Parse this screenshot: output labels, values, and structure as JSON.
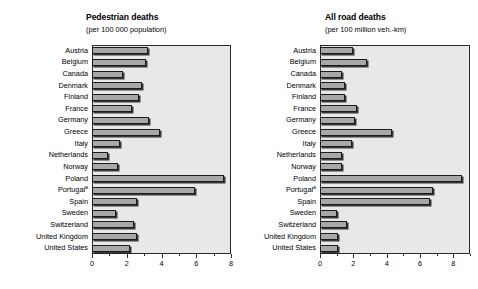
{
  "figure": {
    "background_color": "#ffffff",
    "plot_background_color": "#e8e8e8",
    "bar_color": "#a8a8a8",
    "bar_border_color": "#1c1c1c"
  },
  "chart_data": [
    {
      "type": "bar",
      "orientation": "horizontal",
      "title": "Pedestrian deaths",
      "subtitle": "(per 100 000 population)",
      "xlabel": "",
      "ylabel": "",
      "xlim": [
        0,
        8
      ],
      "xticks": [
        0,
        2,
        4,
        6,
        8
      ],
      "xtick_labels": [
        "0",
        "2",
        "4",
        "6",
        "8"
      ],
      "grid": false,
      "legend": false,
      "categories": [
        "Austria",
        "Belgium",
        "Canada",
        "Denmark",
        "Finland",
        "France",
        "Germany",
        "Greece",
        "Italy",
        "Netherlands",
        "Norway",
        "Poland",
        "Portugal",
        "Spain",
        "Sweden",
        "Switzerland",
        "United Kingdom",
        "United States"
      ],
      "category_footnotes": {
        "Portugal": "a"
      },
      "values": [
        3.2,
        3.1,
        1.8,
        2.9,
        2.7,
        2.3,
        3.3,
        3.9,
        1.6,
        0.9,
        1.5,
        7.6,
        5.9,
        2.6,
        1.4,
        2.4,
        2.6,
        2.2
      ]
    },
    {
      "type": "bar",
      "orientation": "horizontal",
      "title": "All road deaths",
      "subtitle": "(per 100 million veh.-km)",
      "xlabel": "",
      "ylabel": "",
      "xlim": [
        0,
        9
      ],
      "xticks": [
        0,
        2,
        4,
        6,
        8
      ],
      "xtick_labels": [
        "0",
        "2",
        "4",
        "6",
        "8"
      ],
      "grid": false,
      "legend": false,
      "categories": [
        "Austria",
        "Belgium",
        "Canada",
        "Denmark",
        "Finland",
        "France",
        "Germany",
        "Greece",
        "Italy",
        "Netherlands",
        "Norway",
        "Poland",
        "Portugal",
        "Spain",
        "Sweden",
        "Switzerland",
        "United Kingdom",
        "United States"
      ],
      "category_footnotes": {
        "Portugal": "a"
      },
      "values": [
        2.0,
        2.8,
        1.3,
        1.5,
        1.5,
        2.2,
        2.1,
        4.3,
        1.9,
        1.3,
        1.3,
        8.5,
        6.8,
        6.6,
        1.0,
        1.6,
        1.1,
        1.1
      ]
    }
  ]
}
